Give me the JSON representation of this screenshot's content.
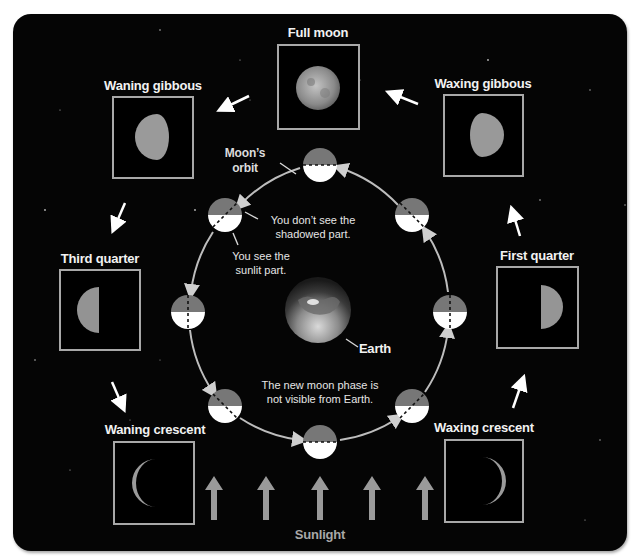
{
  "diagram": {
    "phases": [
      {
        "id": "full-moon",
        "label": "Full moon"
      },
      {
        "id": "waxing-gibbous",
        "label": "Waxing gibbous"
      },
      {
        "id": "first-quarter",
        "label": "First quarter"
      },
      {
        "id": "waxing-crescent",
        "label": "Waxing crescent"
      },
      {
        "id": "waning-gibbous",
        "label": "Waning gibbous"
      },
      {
        "id": "third-quarter",
        "label": "Third quarter"
      },
      {
        "id": "waning-crescent",
        "label": "Waning crescent"
      }
    ],
    "annotations": {
      "orbit_line1": "Moon’s",
      "orbit_line2": "orbit",
      "shadow_line1": "You don’t see the",
      "shadow_line2": "shadowed part.",
      "sunlit_line1": "You see the",
      "sunlit_line2": "sunlit part.",
      "earth": "Earth",
      "newmoon_line1": "The new moon phase is",
      "newmoon_line2": "not visible from Earth.",
      "sunlight": "Sunlight"
    },
    "colors": {
      "background": "#050505",
      "box_border": "#a8a8a8",
      "orbit": "#bdbdbd",
      "moon_dark": "#777777",
      "moon_lit": "#ffffff",
      "sun_arrow": "#9a9a9a"
    }
  }
}
